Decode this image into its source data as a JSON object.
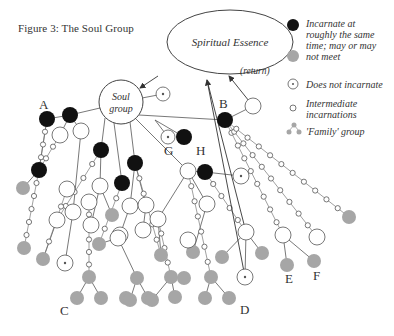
{
  "figure": {
    "title": "Figure 3: The Soul Group",
    "colors": {
      "black": "#111111",
      "gray": "#a6a6a6",
      "stroke": "#555555",
      "white": "#ffffff"
    }
  },
  "essence": {
    "label": "Spiritual Essence",
    "cx": 230,
    "cy": 42,
    "rx": 63,
    "ry": 32
  },
  "soul_group": {
    "label_line1": "Soul",
    "label_line2": "group",
    "cx": 121,
    "cy": 102,
    "r": 22
  },
  "return_label": "(return)",
  "legend": {
    "items": [
      {
        "symbol": "black-dot",
        "text_lines": [
          "Incarnate at",
          "roughly the same"
        ]
      },
      {
        "symbol": "gray-dot",
        "text_lines": [
          "time; may or may",
          "not meet"
        ]
      },
      {
        "symbol": "target-circle",
        "text_lines": [
          "Does not incarnate"
        ]
      },
      {
        "symbol": "small-circle",
        "text_lines": [
          "Intermediate",
          "incarnations"
        ]
      },
      {
        "symbol": "family-cluster",
        "text_lines": [
          "'Family' group"
        ]
      }
    ]
  },
  "labels": [
    {
      "text": "A",
      "x": 39,
      "y": 109
    },
    {
      "text": "B",
      "x": 219,
      "y": 108
    },
    {
      "text": "G",
      "x": 164,
      "y": 155
    },
    {
      "text": "H",
      "x": 196,
      "y": 155
    },
    {
      "text": "C",
      "x": 60,
      "y": 315
    },
    {
      "text": "D",
      "x": 240,
      "y": 314
    },
    {
      "text": "E",
      "x": 285,
      "y": 283
    },
    {
      "text": "F",
      "x": 313,
      "y": 280
    }
  ],
  "nodes": [
    {
      "t": "target",
      "x": 163,
      "y": 94,
      "r": 7
    },
    {
      "t": "black",
      "x": 47,
      "y": 119,
      "r": 8
    },
    {
      "t": "black",
      "x": 70,
      "y": 115,
      "r": 8
    },
    {
      "t": "white",
      "x": 60,
      "y": 135,
      "r": 8
    },
    {
      "t": "white",
      "x": 81,
      "y": 131,
      "r": 8
    },
    {
      "t": "black",
      "x": 39,
      "y": 170,
      "r": 8
    },
    {
      "t": "gray",
      "x": 23,
      "y": 188,
      "r": 7
    },
    {
      "t": "black",
      "x": 101,
      "y": 150,
      "r": 8
    },
    {
      "t": "black",
      "x": 122,
      "y": 183,
      "r": 8
    },
    {
      "t": "black",
      "x": 135,
      "y": 163,
      "r": 8
    },
    {
      "t": "white",
      "x": 67,
      "y": 189,
      "r": 8
    },
    {
      "t": "white",
      "x": 57,
      "y": 220,
      "r": 8
    },
    {
      "t": "white",
      "x": 73,
      "y": 212,
      "r": 8
    },
    {
      "t": "white",
      "x": 89,
      "y": 202,
      "r": 8
    },
    {
      "t": "white",
      "x": 100,
      "y": 186,
      "r": 8
    },
    {
      "t": "gray",
      "x": 112,
      "y": 215,
      "r": 7
    },
    {
      "t": "white",
      "x": 91,
      "y": 225,
      "r": 8
    },
    {
      "t": "white",
      "x": 130,
      "y": 206,
      "r": 8
    },
    {
      "t": "white",
      "x": 146,
      "y": 205,
      "r": 8
    },
    {
      "t": "white",
      "x": 120,
      "y": 235,
      "r": 8
    },
    {
      "t": "white",
      "x": 143,
      "y": 230,
      "r": 8
    },
    {
      "t": "gray",
      "x": 24,
      "y": 248,
      "r": 7
    },
    {
      "t": "gray",
      "x": 43,
      "y": 259,
      "r": 7
    },
    {
      "t": "target",
      "x": 65,
      "y": 263,
      "r": 8
    },
    {
      "t": "gray",
      "x": 89,
      "y": 277,
      "r": 7
    },
    {
      "t": "gray",
      "x": 77,
      "y": 298,
      "r": 7
    },
    {
      "t": "gray",
      "x": 101,
      "y": 298,
      "r": 7
    },
    {
      "t": "gray",
      "x": 126,
      "y": 298,
      "r": 7
    },
    {
      "t": "gray",
      "x": 99,
      "y": 244,
      "r": 7
    },
    {
      "t": "white",
      "x": 118,
      "y": 238,
      "r": 8
    },
    {
      "t": "gray",
      "x": 137,
      "y": 278,
      "r": 7
    },
    {
      "t": "gray",
      "x": 130,
      "y": 300,
      "r": 7
    },
    {
      "t": "gray",
      "x": 148,
      "y": 298,
      "r": 7
    },
    {
      "t": "gray",
      "x": 161,
      "y": 255,
      "r": 7
    },
    {
      "t": "gray",
      "x": 171,
      "y": 277,
      "r": 7
    },
    {
      "t": "gray",
      "x": 184,
      "y": 278,
      "r": 7
    },
    {
      "t": "gray",
      "x": 152,
      "y": 300,
      "r": 7
    },
    {
      "t": "gray",
      "x": 175,
      "y": 297,
      "r": 7
    },
    {
      "t": "white",
      "x": 158,
      "y": 219,
      "r": 8
    },
    {
      "t": "gray",
      "x": 193,
      "y": 252,
      "r": 7
    },
    {
      "t": "gray",
      "x": 211,
      "y": 277,
      "r": 7
    },
    {
      "t": "gray",
      "x": 205,
      "y": 298,
      "r": 7
    },
    {
      "t": "gray",
      "x": 229,
      "y": 298,
      "r": 7
    },
    {
      "t": "white",
      "x": 188,
      "y": 171,
      "r": 8
    },
    {
      "t": "black",
      "x": 205,
      "y": 172,
      "r": 8
    },
    {
      "t": "target",
      "x": 241,
      "y": 176,
      "r": 8
    },
    {
      "t": "white",
      "x": 207,
      "y": 204,
      "r": 8
    },
    {
      "t": "white",
      "x": 188,
      "y": 240,
      "r": 8
    },
    {
      "t": "white",
      "x": 246,
      "y": 232,
      "r": 8
    },
    {
      "t": "target",
      "x": 245,
      "y": 277,
      "r": 8
    },
    {
      "t": "gray",
      "x": 222,
      "y": 257,
      "r": 7
    },
    {
      "t": "gray",
      "x": 262,
      "y": 253,
      "r": 7
    },
    {
      "t": "white",
      "x": 283,
      "y": 235,
      "r": 8
    },
    {
      "t": "gray",
      "x": 287,
      "y": 265,
      "r": 7
    },
    {
      "t": "gray",
      "x": 314,
      "y": 261,
      "r": 7
    },
    {
      "t": "white",
      "x": 317,
      "y": 237,
      "r": 8
    },
    {
      "t": "gray",
      "x": 349,
      "y": 217,
      "r": 7
    },
    {
      "t": "target",
      "x": 168,
      "y": 137,
      "r": 7
    },
    {
      "t": "black",
      "x": 184,
      "y": 137,
      "r": 8
    },
    {
      "t": "black",
      "x": 225,
      "y": 120,
      "r": 8
    },
    {
      "t": "white",
      "x": 253,
      "y": 106,
      "r": 8
    }
  ],
  "edges": [
    [
      121,
      102,
      163,
      94
    ],
    [
      100,
      108,
      70,
      115
    ],
    [
      70,
      115,
      47,
      119
    ],
    [
      70,
      115,
      60,
      135
    ],
    [
      70,
      115,
      81,
      131
    ],
    [
      105,
      118,
      101,
      150
    ],
    [
      114,
      123,
      122,
      183
    ],
    [
      130,
      122,
      135,
      163
    ],
    [
      139,
      115,
      225,
      120
    ],
    [
      155,
      120,
      168,
      137
    ],
    [
      155,
      120,
      184,
      137
    ],
    [
      225,
      120,
      253,
      106
    ],
    [
      135,
      118,
      188,
      171
    ],
    [
      188,
      171,
      205,
      172
    ],
    [
      205,
      172,
      241,
      176
    ],
    [
      101,
      150,
      100,
      186
    ],
    [
      100,
      186,
      91,
      225
    ],
    [
      100,
      186,
      112,
      215
    ],
    [
      135,
      163,
      130,
      206
    ],
    [
      135,
      163,
      146,
      205
    ],
    [
      130,
      206,
      120,
      235
    ],
    [
      146,
      205,
      143,
      230
    ],
    [
      188,
      171,
      207,
      204
    ],
    [
      207,
      204,
      193,
      252
    ],
    [
      188,
      171,
      158,
      219
    ],
    [
      158,
      219,
      161,
      255
    ],
    [
      246,
      232,
      222,
      257
    ],
    [
      246,
      232,
      262,
      253
    ],
    [
      246,
      232,
      245,
      277
    ],
    [
      283,
      235,
      287,
      265
    ],
    [
      283,
      235,
      314,
      261
    ],
    [
      118,
      238,
      99,
      244
    ],
    [
      118,
      238,
      137,
      278
    ],
    [
      137,
      278,
      130,
      300
    ],
    [
      137,
      278,
      148,
      298
    ],
    [
      89,
      277,
      77,
      298
    ],
    [
      89,
      277,
      101,
      298
    ],
    [
      171,
      277,
      152,
      300
    ],
    [
      171,
      277,
      175,
      297
    ],
    [
      211,
      277,
      205,
      298
    ],
    [
      211,
      277,
      229,
      298
    ],
    [
      47,
      119,
      39,
      170
    ],
    [
      39,
      170,
      23,
      188
    ],
    [
      81,
      131,
      73,
      212
    ],
    [
      73,
      212,
      65,
      263
    ],
    [
      57,
      220,
      43,
      259
    ]
  ],
  "chains": [
    {
      "from": [
        47,
        119
      ],
      "to": [
        39,
        170
      ],
      "n": 3
    },
    {
      "from": [
        39,
        170
      ],
      "to": [
        24,
        248
      ],
      "n": 5
    },
    {
      "from": [
        60,
        135
      ],
      "to": [
        39,
        170
      ],
      "n": 2
    },
    {
      "from": [
        101,
        150
      ],
      "to": [
        57,
        220
      ],
      "n": 4
    },
    {
      "from": [
        67,
        189
      ],
      "to": [
        43,
        259
      ],
      "n": 3
    },
    {
      "from": [
        89,
        202
      ],
      "to": [
        89,
        277
      ],
      "n": 5
    },
    {
      "from": [
        122,
        183
      ],
      "to": [
        99,
        244
      ],
      "n": 3
    },
    {
      "from": [
        135,
        163
      ],
      "to": [
        161,
        255
      ],
      "n": 5
    },
    {
      "from": [
        158,
        219
      ],
      "to": [
        171,
        277
      ],
      "n": 3
    },
    {
      "from": [
        188,
        171
      ],
      "to": [
        211,
        277
      ],
      "n": 6
    },
    {
      "from": [
        205,
        172
      ],
      "to": [
        246,
        232
      ],
      "n": 4
    },
    {
      "from": [
        225,
        120
      ],
      "to": [
        283,
        235
      ],
      "n": 8
    },
    {
      "from": [
        225,
        120
      ],
      "to": [
        317,
        237
      ],
      "n": 9
    },
    {
      "from": [
        225,
        120
      ],
      "to": [
        349,
        217
      ],
      "n": 10
    }
  ],
  "arrows": [
    {
      "from": [
        158,
        76
      ],
      "to": [
        140,
        88
      ],
      "name": "essence-to-soul-arrow"
    },
    {
      "from": [
        253,
        106
      ],
      "to": [
        229,
        76
      ],
      "name": "return-arrow"
    },
    {
      "from": [
        245,
        277
      ],
      "to": [
        207,
        80
      ],
      "name": "d-to-essence-arrow"
    },
    {
      "from": [
        207,
        80
      ],
      "to": [
        246,
        232
      ],
      "name": "essence-line"
    }
  ]
}
